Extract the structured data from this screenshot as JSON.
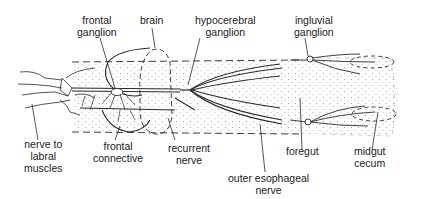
{
  "diagram": {
    "labels": {
      "frontal_ganglion": [
        "frontal",
        "ganglion"
      ],
      "brain": [
        "brain"
      ],
      "hypocerebral_ganglion": [
        "hypocerebral",
        "ganglion"
      ],
      "ingluvial_ganglion": [
        "ingluvial",
        "ganglion"
      ],
      "nerve_to_labral_muscles": [
        "nerve to",
        "labral",
        "muscles"
      ],
      "frontal_connective": [
        "frontal",
        "connective"
      ],
      "recurrent_nerve": [
        "recurrent",
        "nerve"
      ],
      "outer_esophageal_nerve": [
        "outer esophageal",
        "nerve"
      ],
      "foregut": [
        "foregut"
      ],
      "midgut_cecum": [
        "midgut",
        "cecum"
      ]
    },
    "colors": {
      "line": "#2a2a2a",
      "stipple": "#9a9a9a",
      "background": "#ffffff"
    }
  }
}
